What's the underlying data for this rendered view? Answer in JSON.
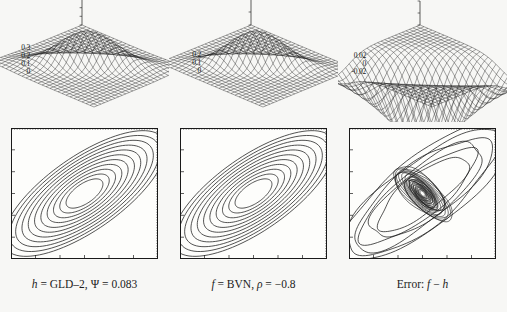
{
  "figure": {
    "background_color": "#f7f7f5",
    "ink_color": "#1a1a1a",
    "columns": 3
  },
  "panels": [
    {
      "id": "gld2",
      "surface": {
        "name": "surface-plot-gld2",
        "z_ticks": [
          "0.3",
          "0.2",
          "0.1",
          "0"
        ],
        "z_min": 0,
        "z_max": 0.3,
        "peak_value": 0.3,
        "mesh_rows": 26,
        "mesh_cols": 26,
        "description": "GLD-2 approximation density surface"
      },
      "contour": {
        "name": "contour-plot-gld2",
        "orientation": "negative",
        "n_levels": 11,
        "correlation_sign": "negative",
        "center_x": 0.5,
        "center_y": 0.5
      },
      "caption": {
        "lhs": "h",
        "eq1": " = GLD–2, ",
        "param_symbol": "Ψ",
        "eq2": " = ",
        "param_value": "0.083",
        "full": "h = GLD–2, Ψ = 0.083"
      }
    },
    {
      "id": "bvn",
      "surface": {
        "name": "surface-plot-bvn",
        "z_ticks": [
          "0.2",
          "0.1",
          "0"
        ],
        "z_min": 0,
        "z_max": 0.2,
        "peak_value": 0.2,
        "mesh_rows": 26,
        "mesh_cols": 26,
        "description": "Bivariate normal density surface"
      },
      "contour": {
        "name": "contour-plot-bvn",
        "orientation": "negative",
        "n_levels": 11,
        "correlation_sign": "negative",
        "center_x": 0.5,
        "center_y": 0.5
      },
      "caption": {
        "lhs": "f",
        "eq1": " = BVN, ",
        "param_symbol": "ρ",
        "eq2": " = ",
        "param_value": "−0.8",
        "full": "f = BVN, ρ = −0.8"
      }
    },
    {
      "id": "error",
      "surface": {
        "name": "surface-plot-error",
        "z_ticks": [
          "0.02",
          "0",
          "-0.02"
        ],
        "z_min": -0.02,
        "z_max": 0.02,
        "peak_value": 0.02,
        "mesh_rows": 26,
        "mesh_cols": 26,
        "description": "Error surface f minus h"
      },
      "contour": {
        "name": "contour-plot-error",
        "orientation": "positive",
        "n_levels": 9,
        "correlation_sign": "positive",
        "center_x": 0.5,
        "center_y": 0.5
      },
      "caption": {
        "lhs": "Error:",
        "eq1": " ",
        "param_symbol": "f",
        "eq2": " − ",
        "param_value": "h",
        "full": "Error: f − h"
      }
    }
  ],
  "chart_data": {
    "type": "line",
    "title": "",
    "subtitle": "",
    "xlabel": "",
    "ylabel": "",
    "grid": false,
    "legend_position": "none",
    "panels": [
      {
        "panel": "h = GLD-2, Ψ = 0.083",
        "surface_z_ticks": [
          0.3,
          0.2,
          0.1,
          0
        ],
        "surface_zlim": [
          0,
          0.3
        ],
        "contour_levels": 11,
        "contour_tilt_deg": -35
      },
      {
        "panel": "f = BVN, ρ = -0.8",
        "surface_z_ticks": [
          0.2,
          0.1,
          0
        ],
        "surface_zlim": [
          0,
          0.2
        ],
        "contour_levels": 11,
        "contour_tilt_deg": -35
      },
      {
        "panel": "Error: f - h",
        "surface_z_ticks": [
          0.02,
          0,
          -0.02
        ],
        "surface_zlim": [
          -0.02,
          0.02
        ],
        "contour_levels": 9,
        "contour_tilt_deg": 40
      }
    ]
  }
}
